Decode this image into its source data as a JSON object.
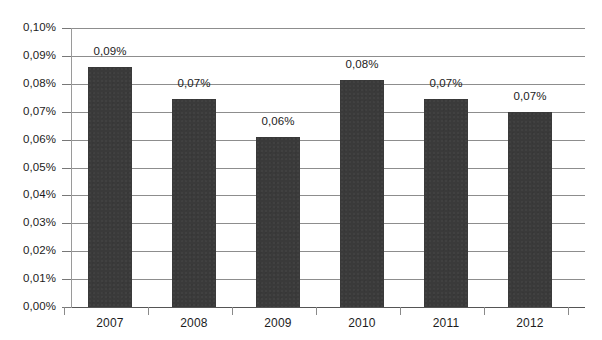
{
  "chart_data": {
    "type": "bar",
    "title": "",
    "subtitle": "",
    "xlabel": "",
    "ylabel": "",
    "categories": [
      "2007",
      "2008",
      "2009",
      "2010",
      "2011",
      "2012"
    ],
    "values": [
      0.086,
      0.0745,
      0.061,
      0.0815,
      0.0745,
      0.07
    ],
    "data_labels": [
      "0,09%",
      "0,07%",
      "0,06%",
      "0,08%",
      "0,07%",
      "0,07%"
    ],
    "ylim": [
      0,
      0.1
    ],
    "ytick_values": [
      0.0,
      0.01,
      0.02,
      0.03,
      0.04,
      0.05,
      0.06,
      0.07,
      0.08,
      0.09,
      0.1
    ],
    "ytick_labels": [
      "0,00%",
      "0,01%",
      "0,02%",
      "0,03%",
      "0,04%",
      "0,05%",
      "0,06%",
      "0,07%",
      "0,08%",
      "0,09%",
      "0,10%"
    ],
    "grid": true,
    "grid_axis": "y",
    "legend": false,
    "legend_position": "none",
    "decimal_separator": ",",
    "units": "%",
    "series": [
      {
        "name": "",
        "values": [
          0.086,
          0.0745,
          0.061,
          0.0815,
          0.0745,
          0.07
        ],
        "color": "#3a3a3a"
      }
    ],
    "colors": {
      "bar": "#3a3a3a",
      "gridline": "#8d8d8d",
      "axis": "#9a9a9a",
      "text": "#1c1c1c",
      "background": "#ffffff"
    }
  }
}
